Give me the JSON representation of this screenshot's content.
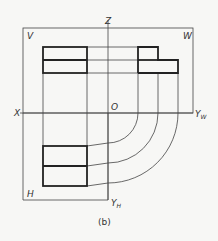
{
  "labels": {
    "v": "V",
    "w": "W",
    "h": "H",
    "z": "Z",
    "x": "X",
    "o": "O",
    "yw": "Y",
    "yw_sub": "W",
    "yh": "Y",
    "yh_sub": "H"
  },
  "caption": "(b)",
  "colors": {
    "line": "#222222",
    "background": "#f7f7f5"
  }
}
